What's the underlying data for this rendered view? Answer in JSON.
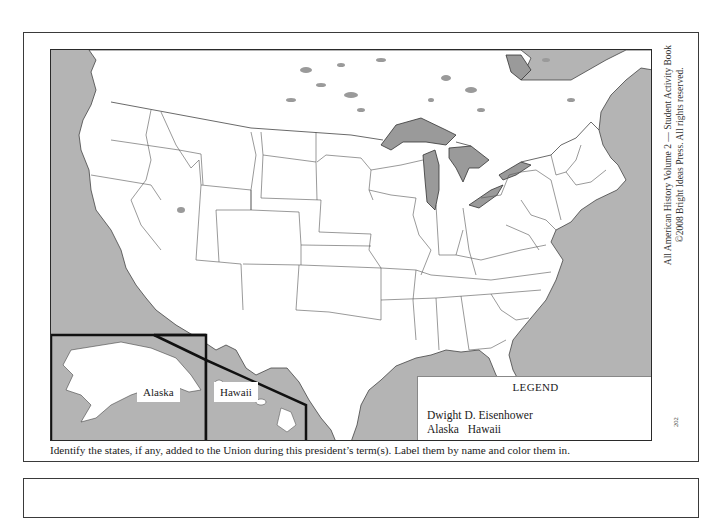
{
  "map": {
    "title": "United States outline map",
    "colors": {
      "water": "#b4b4b4",
      "land": "#ffffff",
      "border": "#333333",
      "inset_border": "#111111"
    },
    "insets": [
      {
        "label": "Alaska"
      },
      {
        "label": "Hawaii"
      }
    ],
    "legend": {
      "title": "LEGEND",
      "president": "Dwight D. Eisenhower",
      "states": "Alaska Hawaii"
    }
  },
  "side_credit": {
    "line1": "All American History Volume 2 — Student Activity Book",
    "line2": "©2008 Bright Ideas Press. All rights reserved."
  },
  "page_number": "202",
  "instruction": "Identify the states, if any, added to the Union during this president’s term(s). Label them by name and color them in."
}
